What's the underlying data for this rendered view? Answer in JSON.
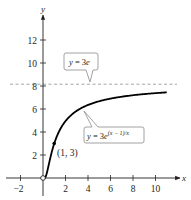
{
  "chart_data": {
    "type": "line",
    "title": "",
    "xlabel": "x",
    "ylabel": "y",
    "xlim": [
      -2.6,
      12
    ],
    "ylim": [
      -1.5,
      14
    ],
    "x_ticks": [
      -2,
      2,
      4,
      6,
      8,
      10
    ],
    "y_ticks": [
      2,
      4,
      6,
      8,
      10,
      12
    ],
    "x_tick_labels": [
      "−2",
      "2",
      "4",
      "6",
      "8",
      "10"
    ],
    "y_tick_labels": [
      "2",
      "4",
      "6",
      "8",
      "10",
      "12"
    ],
    "grid": false,
    "series": [
      {
        "name": "y = 3e^((x − 1)/x)",
        "function": "3*exp((x-1)/x)",
        "domain": [
          0,
          11
        ],
        "style": "solid",
        "color": "#000000"
      },
      {
        "name": "y = 3e",
        "function": "3e",
        "value": 8.155,
        "style": "dashed",
        "color": "#9a9a9a"
      }
    ],
    "points": [
      {
        "x": 0,
        "y": 0,
        "style": "open-circle"
      },
      {
        "x": 1,
        "y": 3,
        "label": "(1, 3)",
        "style": "filled"
      }
    ],
    "annotations": [
      {
        "text": "y = 3e",
        "target": "asymptote"
      },
      {
        "text": "y = 3e^((x − 1)/x)",
        "target": "curve"
      }
    ]
  },
  "labels": {
    "x_axis": "x",
    "y_axis": "y",
    "x_ticks": [
      "−2",
      "2",
      "4",
      "6",
      "8",
      "10"
    ],
    "y_ticks": [
      "2",
      "4",
      "6",
      "8",
      "10",
      "12"
    ],
    "asymptote_callout": {
      "lhs": "y",
      "eq": " = 3",
      "rhs": "e"
    },
    "curve_callout": {
      "lhs": "y",
      "eq": " = 3",
      "base": "e",
      "exp": "(x − 1)/x"
    },
    "point_label": "(1, 3)"
  },
  "colors": {
    "axis": "#231f20",
    "curve": "#000000",
    "asymptote": "#9a9a9a",
    "callout_border": "#8c8c8c"
  }
}
